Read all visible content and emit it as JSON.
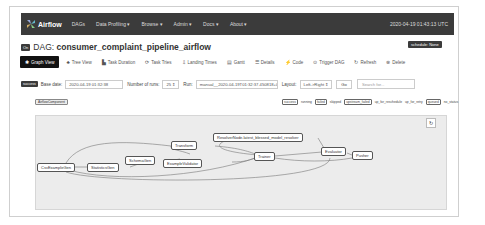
{
  "navbar": {
    "brand": "Airflow",
    "items": [
      "DAGs",
      "Data Profiling ▾",
      "Browse ▾",
      "Admin ▾",
      "Docs ▾",
      "About ▾"
    ],
    "time": "2020-04-19 01:43:13 UTC"
  },
  "dag": {
    "on_badge": "On",
    "title_prefix": "DAG: ",
    "title": "consumer_complaint_pipeline_airflow",
    "schedule": "schedule: None"
  },
  "tabs": [
    {
      "icon": "✱",
      "label": "Graph View",
      "active": true
    },
    {
      "icon": "♣",
      "label": "Tree View"
    },
    {
      "icon": "▙",
      "label": "Task Duration"
    },
    {
      "icon": "⟳",
      "label": "Task Tries"
    },
    {
      "icon": "⇩",
      "label": "Landing Times"
    },
    {
      "icon": "▤",
      "label": "Gantt"
    },
    {
      "icon": "☰",
      "label": "Details"
    },
    {
      "icon": "⚡",
      "label": "Code"
    },
    {
      "icon": "⊙",
      "label": "Trigger DAG"
    },
    {
      "icon": "↻",
      "label": "Refresh"
    },
    {
      "icon": "⊗",
      "label": "Delete"
    }
  ],
  "controls": {
    "state_badge": "success",
    "base_date_label": "Base date:",
    "base_date_value": "2020-04-19 01:32:38",
    "num_runs_label": "Number of runs:",
    "num_runs_value": "25 ⇕",
    "run_label": "Run:",
    "run_value": "manual__2020-04-19T01:32:37.450818+00:00 ⇕",
    "layout_label": "Layout:",
    "layout_value": "Left->Right ⇕",
    "go_label": "Go",
    "search_placeholder": "Search for..."
  },
  "operator_badge": "AirflowComponent",
  "legend": [
    "success",
    "running",
    "failed",
    "skipped",
    "upstream_failed",
    "up_for_reschedule",
    "up_for_retry",
    "queued",
    "no_status"
  ],
  "graph": {
    "refresh_icon": "↻",
    "nodes": [
      {
        "id": "CsvExampleGen",
        "label": "CsvExampleGen"
      },
      {
        "id": "StatisticsGen",
        "label": "StatisticsGen"
      },
      {
        "id": "SchemaGen",
        "label": "SchemaGen"
      },
      {
        "id": "Transform",
        "label": "Transform"
      },
      {
        "id": "ExampleValidator",
        "label": "ExampleValidator"
      },
      {
        "id": "ResolverNode",
        "label": "ResolverNode.latest_blessed_model_resolver"
      },
      {
        "id": "Trainer",
        "label": "Trainer"
      },
      {
        "id": "Evaluator",
        "label": "Evaluator"
      },
      {
        "id": "Pusher",
        "label": "Pusher"
      }
    ]
  }
}
